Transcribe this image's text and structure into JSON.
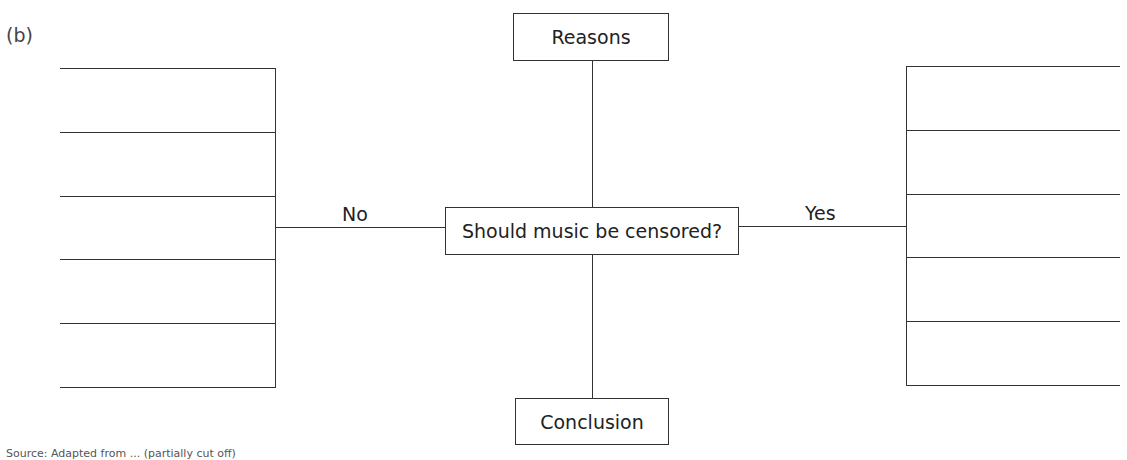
{
  "panel_label": "(b)",
  "diagram": {
    "central_question": "Should music be censored?",
    "top_box": "Reasons",
    "bottom_box": "Conclusion",
    "left_branch_label": "No",
    "right_branch_label": "Yes",
    "left_lines_count": 6,
    "right_lines_count": 6
  },
  "caption": "Source: Adapted from ... (partially cut off)"
}
